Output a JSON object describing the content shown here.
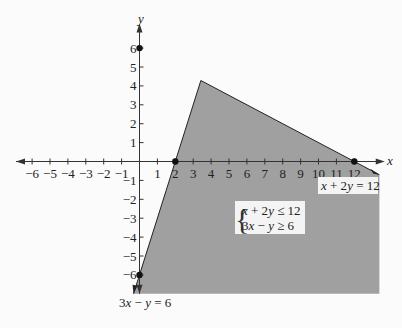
{
  "chart_data": {
    "type": "area",
    "title": "",
    "xlabel": "x",
    "ylabel": "y",
    "xlim": [
      -6.8,
      13.6
    ],
    "ylim": [
      -7.0,
      7.2
    ],
    "grid": false,
    "x_ticks": [
      -6,
      -5,
      -4,
      -3,
      -2,
      -1,
      1,
      2,
      3,
      4,
      5,
      6,
      7,
      8,
      9,
      10,
      11,
      12
    ],
    "y_ticks": [
      -6,
      -5,
      -4,
      -3,
      -2,
      -1,
      1,
      2,
      3,
      4,
      5,
      6
    ],
    "x_tick_labels": [
      "−6",
      "−5",
      "−4",
      "−3",
      "−2",
      "−1",
      "1",
      "2",
      "3",
      "4",
      "5",
      "6",
      "7",
      "8",
      "9",
      "10",
      "11",
      "12"
    ],
    "y_tick_labels": [
      "−6",
      "−5",
      "−4",
      "−3",
      "−2",
      "−1",
      "1",
      "2",
      "3",
      "4",
      "5",
      "6"
    ],
    "lines": [
      {
        "name": "x + 2y = 12",
        "a": 1,
        "b": 2,
        "c": 12,
        "x_range": [
          3.4286,
          13.4
        ]
      },
      {
        "name": "3x − y = 6",
        "a": 3,
        "b": -1,
        "c": 6,
        "x_range": [
          -0.333,
          3.4286
        ]
      }
    ],
    "feasible_region": {
      "description": "x + 2y ≤ 12 and 3x − y ≥ 6",
      "vertices": [
        [
          3.4286,
          4.2857
        ],
        [
          13.4,
          -0.7
        ],
        [
          13.4,
          -7.0
        ],
        [
          -0.333,
          -7.0
        ]
      ],
      "fill": "#a0a0a0"
    },
    "points": [
      {
        "x": 0,
        "y": 6
      },
      {
        "x": 2,
        "y": 0
      },
      {
        "x": 12,
        "y": 0
      },
      {
        "x": 0,
        "y": -6
      }
    ],
    "annotations": {
      "line1_label": {
        "pre": "x",
        "mid": " + 2",
        "var": "y",
        "post": " = 12"
      },
      "line2_label": {
        "pre": "3",
        "var1": "x",
        "mid": " − ",
        "var2": "y",
        "post": " = 6"
      },
      "system": {
        "row1": {
          "a": "x",
          "b": " + 2",
          "c": "y",
          "d": " ≤ 12"
        },
        "row2": {
          "a": "3",
          "b": "x",
          "c": " − ",
          "d": "y",
          "e": " ≥ 6"
        }
      }
    }
  }
}
